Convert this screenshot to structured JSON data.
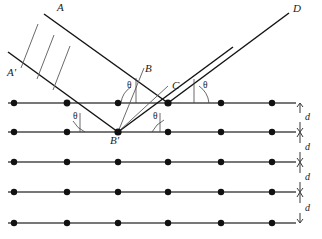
{
  "figure": {
    "type": "bragg-diffraction-diagram",
    "title": "",
    "width": 322,
    "height": 239,
    "background_color": "#ffffff",
    "ink_color": "#1a1a1a"
  },
  "labels": {
    "incident_ray_upper": "A",
    "incident_ray_lower": "A'",
    "point_b": "B",
    "point_c": "C",
    "point_b_prime": "B'",
    "outgoing_ray": "D",
    "theta": "θ",
    "spacing": "d"
  },
  "angles": [
    {
      "id": "theta-upper-left",
      "label": "θ",
      "x": 131,
      "y": 82
    },
    {
      "id": "theta-upper-right",
      "label": "θ",
      "x": 206,
      "y": 82
    },
    {
      "id": "theta-lower-left",
      "label": "θ",
      "x": 78,
      "y": 114
    },
    {
      "id": "theta-lower-right",
      "label": "θ",
      "x": 156,
      "y": 114
    }
  ],
  "points": [
    {
      "id": "A",
      "label": "A",
      "x": 57,
      "y": 4
    },
    {
      "id": "Aprime",
      "label": "A'",
      "x": 8,
      "y": 68
    },
    {
      "id": "B",
      "label": "B",
      "x": 146,
      "y": 64
    },
    {
      "id": "C",
      "label": "C",
      "x": 172,
      "y": 82
    },
    {
      "id": "Bprime",
      "label": "B'",
      "x": 110,
      "y": 136
    },
    {
      "id": "D",
      "label": "D",
      "x": 293,
      "y": 5
    }
  ],
  "spacings": [
    {
      "label": "d",
      "x": 300,
      "y_top": 103,
      "y_bottom": 132
    },
    {
      "label": "d",
      "x": 300,
      "y_top": 132,
      "y_bottom": 162
    },
    {
      "label": "d",
      "x": 300,
      "y_top": 162,
      "y_bottom": 192
    },
    {
      "label": "d",
      "x": 300,
      "y_top": 192,
      "y_bottom": 223
    }
  ],
  "lattice": {
    "plane_count": 5,
    "atoms_per_plane": 6,
    "plane_y": [
      103,
      132,
      162,
      192,
      223
    ],
    "atom_x": [
      14,
      67,
      118,
      168,
      221,
      272
    ],
    "line_x_start": 8,
    "line_x_end": 296,
    "atom_radius": 3.2,
    "atom_color": "#111111",
    "plane_line_color": "#4a4a4a"
  },
  "rays": {
    "incident_upper": {
      "from_x": 44,
      "from_y": 14,
      "to_x": 168,
      "to_y": 103
    },
    "incident_lower": {
      "from_x": 8,
      "from_y": 52,
      "to_x": 118,
      "to_y": 132
    },
    "reflected_upper": {
      "from_x": 168,
      "from_y": 103,
      "to_x": 288,
      "to_y": 14
    },
    "reflected_lower": {
      "from_x": 118,
      "from_y": 132,
      "to_x": 232,
      "to_y": 48
    },
    "perpendicular_b": {
      "from_x": 118,
      "from_y": 132,
      "to_x": 146,
      "to_y": 72
    },
    "perpendicular_c": {
      "from_x": 118,
      "from_y": 132,
      "to_x": 168,
      "to_y": 90
    }
  },
  "wavefronts": [
    {
      "id": "wavefront-1",
      "x1": 38,
      "y1": 24,
      "x2": 21,
      "y2": 68
    },
    {
      "id": "wavefront-2",
      "x1": 54,
      "y1": 35,
      "x2": 37,
      "y2": 79
    },
    {
      "id": "wavefront-3",
      "x1": 70,
      "y1": 46,
      "x2": 53,
      "y2": 90
    }
  ]
}
